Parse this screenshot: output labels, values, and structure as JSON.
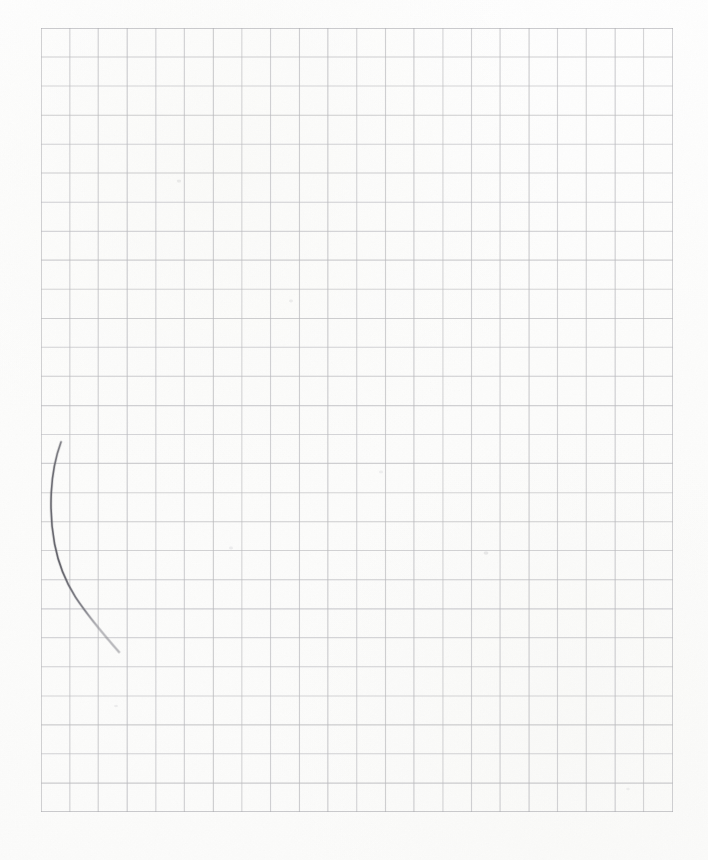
{
  "document": {
    "kind": "scanned-graph-paper-sheet",
    "title": "Blank graph paper with hand-drawn curve",
    "page_width": 708,
    "page_height": 860,
    "background_color": "#fdfdfc",
    "margin_color": "#fefefe"
  },
  "grid": {
    "label": "graph-paper-grid",
    "origin_x": 41,
    "origin_y": 28,
    "width": 632,
    "height": 784,
    "columns": 22,
    "rows": 27,
    "cell_size": 28.7,
    "line_color": "#b9b9bd",
    "line_width": 1.1,
    "border_color": "#a9a9ae",
    "border_width": 1.3,
    "minor_lines": false
  },
  "annotations": {
    "curve": {
      "label": "hand-drawn-pencil-curve",
      "stroke_color": "#6d6d74",
      "stroke_width": 1.6,
      "start_point": [
        61,
        442
      ],
      "end_point": [
        119,
        652
      ],
      "leftmost_point": [
        51,
        520
      ],
      "path": "M 61 442 C 55.5 457 52.4 471 51.3 492 C 50.4 510 51.2 526 54.6 544 C 58.4 564 65.2 581 75.4 597 C 86.0 613 100.5 631 119 652",
      "description": "A single faint pencil arc curving from upper-left downward and to the right."
    }
  },
  "marks": {
    "smudges": [
      {
        "x": 179,
        "y": 181,
        "r": 2.2,
        "opacity": 0.18
      },
      {
        "x": 291,
        "y": 301,
        "r": 2.0,
        "opacity": 0.16
      },
      {
        "x": 486,
        "y": 553,
        "r": 2.4,
        "opacity": 0.2
      },
      {
        "x": 116,
        "y": 706,
        "r": 1.9,
        "opacity": 0.15
      },
      {
        "x": 381,
        "y": 472,
        "r": 2.0,
        "opacity": 0.14
      },
      {
        "x": 231,
        "y": 548,
        "r": 2.1,
        "opacity": 0.15
      },
      {
        "x": 628,
        "y": 789,
        "r": 1.8,
        "opacity": 0.13
      }
    ]
  }
}
